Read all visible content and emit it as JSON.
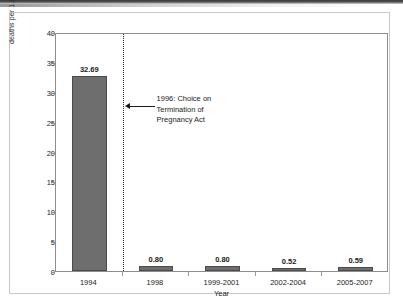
{
  "chart_data": {
    "type": "bar",
    "title": "",
    "xlabel": "Year",
    "ylabel": "deaths per 1,000 abortions",
    "categories": [
      "1994",
      "1998",
      "1999-2001",
      "2002-2004",
      "2005-2007"
    ],
    "values": [
      32.69,
      0.8,
      0.8,
      0.52,
      0.59
    ],
    "value_labels": [
      "32.69",
      "0.80",
      "0.80",
      "0.52",
      "0.59"
    ],
    "ylim": [
      0,
      40
    ],
    "yticks": [
      0,
      5,
      10,
      15,
      20,
      25,
      30,
      35,
      40
    ],
    "ytick_labels": [
      "0",
      "5",
      "10",
      "15",
      "20",
      "25",
      "30",
      "35",
      "40"
    ],
    "grid": false,
    "legend": null,
    "bar_color": "#6e6e6e",
    "bar_edge_color": "#4a4a4a",
    "annotations": [
      {
        "name": "policy-marker",
        "at_category_boundary_after": "1994",
        "lines": [
          "1996: Choice on",
          "Termination of",
          "Pregnancy Act"
        ],
        "line_style": "dotted-vertical",
        "arrow": "left"
      }
    ]
  },
  "axes": {
    "y_title": "deaths per 1,000 abortions",
    "x_title": "Year"
  },
  "annotation": {
    "line1": "1996: Choice on",
    "line2": "Termination of",
    "line3": "Pregnancy Act"
  }
}
